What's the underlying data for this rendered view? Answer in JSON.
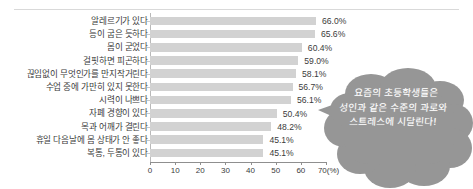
{
  "chart_data": {
    "type": "bar",
    "orientation": "horizontal",
    "title": "",
    "xlabel": "70(%)",
    "ylabel": "",
    "xlim": [
      0,
      70
    ],
    "grid": false,
    "legend": null,
    "axis_unit": "(%)",
    "xticks": [
      "0",
      "10",
      "20",
      "30",
      "40",
      "50",
      "60",
      "70(%)"
    ],
    "xtick_values": [
      0,
      10,
      20,
      30,
      40,
      50,
      60,
      70
    ],
    "categories": [
      "알레르기가 있다",
      "등이 굽은 듯하다",
      "몸이 굳었다",
      "걸핏하면 피곤하다",
      "끊임없이 무엇인가를 만지작거린다",
      "수업 중에 가만히 있지 못한다",
      "시력이 나쁘다",
      "자폐 경향이 있다",
      "목과 어깨가 결린다",
      "휴일 다음날에 몸 상태가 안 좋다",
      "복통, 두통이 있다"
    ],
    "values": [
      66.0,
      65.6,
      60.4,
      59.0,
      58.1,
      56.7,
      56.1,
      50.4,
      48.2,
      45.1,
      45.1
    ],
    "value_labels": [
      "66.0%",
      "65.6%",
      "60.4%",
      "59.0%",
      "58.1%",
      "56.7%",
      "56.1%",
      "50.4%",
      "48.2%",
      "45.1%",
      "45.1%"
    ],
    "bar_color": "#d2d2d2",
    "text_color": "#3b3b3b"
  },
  "callout": {
    "shape": "speech-cloud",
    "color": "#969696",
    "text_color": "#ffffff",
    "lines": [
      "요즘의 초등학생들은",
      "성인과 같은 수준의 과로와",
      "스트레스에 시달린다!"
    ]
  }
}
